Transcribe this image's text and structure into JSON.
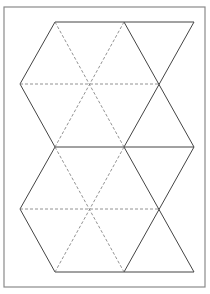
{
  "diagram": {
    "colors": {
      "background": "#ffffff",
      "frame": "#8a8a8a",
      "cut_line": "#444444",
      "fold_line": "#777777"
    },
    "grid": {
      "columns_x": [
        20,
        55,
        89,
        124,
        159,
        194
      ],
      "rows_y": [
        22,
        84,
        147,
        209,
        272
      ]
    },
    "frame": {
      "x": 4,
      "y": 7,
      "width": 201,
      "height": 280
    },
    "solid_lines": [
      [
        55,
        22,
        194,
        22
      ],
      [
        55,
        22,
        20,
        84
      ],
      [
        20,
        84,
        55,
        147
      ],
      [
        124,
        22,
        194,
        147
      ],
      [
        194,
        22,
        124,
        147
      ],
      [
        55,
        147,
        194,
        147
      ],
      [
        55,
        147,
        20,
        209
      ],
      [
        20,
        209,
        55,
        272
      ],
      [
        124,
        147,
        194,
        272
      ],
      [
        194,
        147,
        124,
        272
      ],
      [
        55,
        272,
        194,
        272
      ]
    ],
    "dashed_lines": [
      [
        20,
        84,
        159,
        84
      ],
      [
        55,
        22,
        124,
        147
      ],
      [
        124,
        22,
        55,
        147
      ],
      [
        20,
        209,
        159,
        209
      ],
      [
        55,
        147,
        124,
        272
      ],
      [
        124,
        147,
        55,
        272
      ]
    ]
  }
}
